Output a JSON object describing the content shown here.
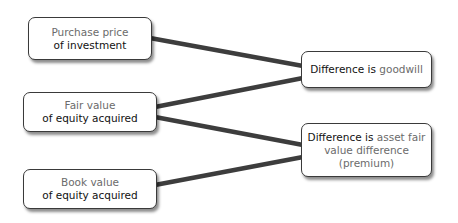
{
  "diagram": {
    "sources": [
      {
        "id": "purchase",
        "line1": "Purchase price",
        "line2": "of investment"
      },
      {
        "id": "fair",
        "line1": "Fair value",
        "line2": "of equity acquired"
      },
      {
        "id": "book",
        "line1": "Book value",
        "line2": "of equity acquired"
      }
    ],
    "results": [
      {
        "id": "goodwill",
        "prefix": "Difference is",
        "suffix": "goodwill"
      },
      {
        "id": "premium",
        "prefix": "Difference is",
        "suffix": "asset fair",
        "line2": "value difference",
        "line3": "(premium)"
      }
    ],
    "connections": [
      {
        "from": "purchase",
        "to": "goodwill"
      },
      {
        "from": "fair",
        "to": "goodwill"
      },
      {
        "from": "fair",
        "to": "premium"
      },
      {
        "from": "book",
        "to": "premium"
      }
    ],
    "colors": {
      "line": "#3d3d3d",
      "muted_text": "#6b6b6b",
      "strong_text": "#111111",
      "border": "#3a3a3a"
    }
  }
}
